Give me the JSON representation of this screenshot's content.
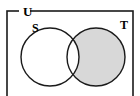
{
  "figure": {
    "kind": "venn-diagram",
    "caption_labels": {
      "universe": "U",
      "left_set": "S",
      "right_set": "T"
    },
    "colors": {
      "page_background": "#ffffff",
      "stroke": "#1a1a1a",
      "shade_fill": "#d8d8d8",
      "unshaded_fill": "#ffffff"
    },
    "geometry": {
      "canvas_width": 140,
      "canvas_height": 96,
      "universe_rect": {
        "x": 7,
        "y": 11,
        "width": 126,
        "height": 95
      },
      "left_circle": {
        "cx": 50,
        "cy": 57,
        "r": 29
      },
      "right_circle": {
        "cx": 96,
        "cy": 57,
        "r": 29
      },
      "stroke_width": 1.4,
      "universe_stroke_width": 1.6
    },
    "label_positions": {
      "universe": {
        "x": 23,
        "y": 16
      },
      "left_set": {
        "x": 32,
        "y": 32
      },
      "right_set": {
        "x": 120,
        "y": 29
      }
    },
    "shaded_region": {
      "name": "T minus S",
      "description": "The portion of circle T that lies outside circle S is shaded; the overlap of S and T is unshaded."
    }
  }
}
